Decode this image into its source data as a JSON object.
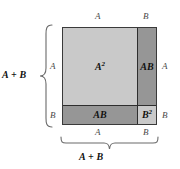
{
  "figure": {
    "colors": {
      "light_region": "#c9c9c9",
      "dark_region": "#969696",
      "outline": "#3a3a3a",
      "label_text": "#111111",
      "edge_text": "#4a4a4a",
      "brace": "#6a6a6a",
      "background": "#ffffff"
    },
    "regions": [
      {
        "id": "a-squared",
        "base": "A",
        "exponent": "2",
        "fill": "light",
        "position": "top-left"
      },
      {
        "id": "ab-right",
        "base": "AB",
        "exponent": "",
        "fill": "dark",
        "position": "top-right"
      },
      {
        "id": "ab-bottom",
        "base": "AB",
        "exponent": "",
        "fill": "dark",
        "position": "bottom-left"
      },
      {
        "id": "b-squared",
        "base": "B",
        "exponent": "2",
        "fill": "light",
        "position": "bottom-right"
      }
    ],
    "edge_labels": {
      "top_left": "A",
      "top_right": "B",
      "right_upper": "A",
      "right_lower": "B",
      "left_upper": "A",
      "left_lower": "B",
      "bottom_left": "A",
      "bottom_right": "B"
    },
    "braces": {
      "left_label": "A + B",
      "bottom_label": "A + B"
    }
  }
}
